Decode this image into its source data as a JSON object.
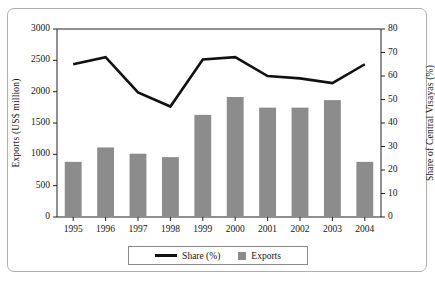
{
  "chart_data": {
    "type": "bar",
    "title": "",
    "subtitle": "",
    "categories": [
      "1995",
      "1996",
      "1997",
      "1998",
      "1999",
      "2000",
      "2001",
      "2002",
      "2003",
      "2004"
    ],
    "series": [
      {
        "name": "Exports",
        "type": "bar",
        "axis": "left",
        "color": "#8c8c8c",
        "values": [
          880,
          1110,
          1010,
          955,
          1630,
          1915,
          1745,
          1745,
          1865,
          880
        ]
      },
      {
        "name": "Share (%)",
        "type": "line",
        "axis": "right",
        "color": "#111111",
        "values": [
          65,
          68,
          53,
          47,
          67,
          68,
          60,
          59,
          57,
          65
        ]
      }
    ],
    "xlabel": "",
    "ylabel": "Exports (US$ million)",
    "y2label": "Share of Central Visayas (%)",
    "ylim": [
      0,
      3000
    ],
    "yticks": [
      0,
      500,
      1000,
      1500,
      2000,
      2500,
      3000
    ],
    "y2lim": [
      0,
      80
    ],
    "y2ticks": [
      0,
      10,
      20,
      30,
      40,
      50,
      60,
      70,
      80
    ],
    "grid": false,
    "legend_position": "bottom-center",
    "legend_entries": [
      {
        "label": "Share (%)",
        "marker": "line",
        "color": "#111111"
      },
      {
        "label": "Exports",
        "marker": "square",
        "color": "#8c8c8c"
      }
    ]
  },
  "axes": {
    "left_title": "Exports (US$ million)",
    "right_title": "Share of Central Visayas (%)",
    "left_ticks": [
      "3000",
      "2500",
      "2000",
      "1500",
      "1000",
      "500",
      "0"
    ],
    "right_ticks": [
      "80",
      "70",
      "60",
      "50",
      "40",
      "30",
      "20",
      "10",
      "0"
    ],
    "x_ticks": [
      "1995",
      "1996",
      "1997",
      "1998",
      "1999",
      "2000",
      "2001",
      "2002",
      "2003",
      "2004"
    ]
  },
  "legend": {
    "share_label": "Share (%)",
    "exports_label": "Exports"
  }
}
